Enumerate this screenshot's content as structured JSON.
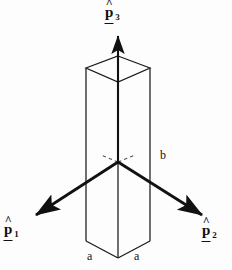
{
  "figure": {
    "background_color": "#fdfdfd",
    "line_color": "#111111",
    "arrow_color": "#111111"
  },
  "axes": [
    {
      "id": "p3",
      "symbol": "p",
      "subscript": "3",
      "accent": "hat",
      "underline": true,
      "direction": "up",
      "arrow_from": [
        118,
        162
      ],
      "arrow_to": [
        118,
        30
      ]
    },
    {
      "id": "p1",
      "symbol": "p",
      "subscript": "1",
      "accent": "hat",
      "underline": true,
      "direction": "down-left",
      "arrow_from": [
        118,
        162
      ],
      "arrow_to": [
        30,
        219
      ]
    },
    {
      "id": "p2",
      "symbol": "p",
      "subscript": "2",
      "accent": "hat",
      "underline": true,
      "direction": "down-right",
      "arrow_from": [
        118,
        162
      ],
      "arrow_to": [
        209,
        219
      ]
    }
  ],
  "dimensions": [
    {
      "id": "b",
      "label": "b",
      "edge": "vertical-right"
    },
    {
      "id": "a1",
      "label": "a",
      "edge": "bottom-left"
    },
    {
      "id": "a2",
      "label": "a",
      "edge": "bottom-right"
    }
  ],
  "solid": {
    "type": "rectangular-prism",
    "top_face": [
      [
        118,
        56
      ],
      [
        150,
        68
      ],
      [
        118,
        82
      ],
      [
        86,
        68
      ]
    ],
    "bottom_front_vertex": [
      118,
      258
    ],
    "bottom_left_vertex": [
      86,
      241
    ],
    "bottom_right_vertex": [
      150,
      241
    ],
    "hidden_edge_style": "dashed"
  }
}
